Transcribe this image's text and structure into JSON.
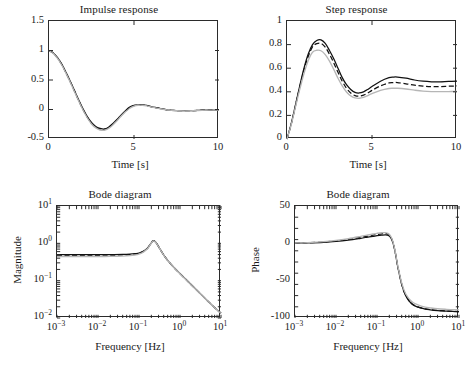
{
  "figure": {
    "panels": [
      "impulse",
      "step",
      "bode_magnitude",
      "bode_phase"
    ]
  },
  "chart_data": [
    {
      "type": "line",
      "id": "impulse",
      "title": "Impulse response",
      "xlabel": "Time [s]",
      "ylabel": "",
      "xlim": [
        0,
        10
      ],
      "ylim": [
        -0.5,
        1.5
      ],
      "xticks": [
        0,
        5,
        10
      ],
      "xticklabels": [
        "0",
        "5",
        "10"
      ],
      "yticks": [
        -0.5,
        0,
        0.5,
        1,
        1.5
      ],
      "yticklabels": [
        "-0.5",
        "0",
        "0.5",
        "1",
        "1.5"
      ],
      "grid": false,
      "legend": "none",
      "x": [
        0,
        0.25,
        0.5,
        0.75,
        1,
        1.25,
        1.5,
        1.75,
        2,
        2.25,
        2.5,
        2.75,
        3,
        3.25,
        3.5,
        3.75,
        4,
        4.25,
        4.5,
        4.75,
        5,
        5.25,
        5.5,
        5.75,
        6,
        6.5,
        7,
        7.5,
        8,
        8.5,
        9,
        9.5,
        10
      ],
      "series": [
        {
          "name": "solid",
          "style": "solid",
          "color": "#111111",
          "values": [
            1.0,
            0.96,
            0.88,
            0.77,
            0.63,
            0.48,
            0.32,
            0.16,
            0.01,
            -0.12,
            -0.22,
            -0.29,
            -0.32,
            -0.33,
            -0.3,
            -0.24,
            -0.17,
            -0.09,
            -0.02,
            0.04,
            0.07,
            0.08,
            0.08,
            0.07,
            0.05,
            0.02,
            -0.01,
            -0.02,
            -0.02,
            -0.02,
            -0.01,
            -0.01,
            -0.01
          ]
        },
        {
          "name": "dashed",
          "style": "dashed",
          "color": "#111111",
          "values": [
            1.0,
            0.955,
            0.873,
            0.762,
            0.622,
            0.47,
            0.31,
            0.15,
            0.0,
            -0.13,
            -0.235,
            -0.3,
            -0.335,
            -0.34,
            -0.31,
            -0.25,
            -0.18,
            -0.1,
            -0.03,
            0.03,
            0.065,
            0.078,
            0.077,
            0.066,
            0.048,
            0.018,
            -0.008,
            -0.018,
            -0.02,
            -0.018,
            -0.012,
            -0.008,
            -0.008
          ]
        },
        {
          "name": "gray",
          "style": "gray",
          "color": "#b6b6b6",
          "values": [
            1.0,
            0.95,
            0.866,
            0.754,
            0.613,
            0.461,
            0.3,
            0.142,
            -0.008,
            -0.14,
            -0.245,
            -0.312,
            -0.348,
            -0.352,
            -0.322,
            -0.262,
            -0.19,
            -0.11,
            -0.04,
            0.022,
            0.058,
            0.072,
            0.072,
            0.062,
            0.044,
            0.014,
            -0.01,
            -0.02,
            -0.022,
            -0.02,
            -0.014,
            -0.01,
            -0.01
          ]
        }
      ]
    },
    {
      "type": "line",
      "id": "step",
      "title": "Step response",
      "xlabel": "Time [s]",
      "ylabel": "",
      "xlim": [
        0,
        10
      ],
      "ylim": [
        0,
        1
      ],
      "xticks": [
        0,
        5,
        10
      ],
      "xticklabels": [
        "0",
        "5",
        "10"
      ],
      "yticks": [
        0,
        0.2,
        0.4,
        0.6,
        0.8,
        1
      ],
      "yticklabels": [
        "0",
        "0.2",
        "0.4",
        "0.6",
        "0.8",
        "1"
      ],
      "grid": false,
      "legend": "none",
      "x": [
        0,
        0.25,
        0.5,
        0.75,
        1,
        1.25,
        1.5,
        1.75,
        2,
        2.25,
        2.5,
        2.75,
        3,
        3.25,
        3.5,
        3.75,
        4,
        4.25,
        4.5,
        4.75,
        5,
        5.5,
        6,
        6.25,
        6.5,
        7,
        7.5,
        8,
        8.5,
        9,
        9.5,
        10
      ],
      "series": [
        {
          "name": "solid",
          "style": "solid",
          "color": "#111111",
          "values": [
            0.0,
            0.13,
            0.29,
            0.45,
            0.6,
            0.72,
            0.8,
            0.835,
            0.84,
            0.81,
            0.75,
            0.68,
            0.6,
            0.52,
            0.46,
            0.42,
            0.395,
            0.39,
            0.4,
            0.42,
            0.445,
            0.49,
            0.52,
            0.525,
            0.525,
            0.515,
            0.5,
            0.49,
            0.485,
            0.485,
            0.488,
            0.49
          ]
        },
        {
          "name": "dashed",
          "style": "dashed",
          "color": "#111111",
          "values": [
            0.0,
            0.127,
            0.283,
            0.44,
            0.585,
            0.7,
            0.78,
            0.808,
            0.81,
            0.778,
            0.718,
            0.645,
            0.565,
            0.49,
            0.43,
            0.39,
            0.368,
            0.363,
            0.372,
            0.39,
            0.412,
            0.45,
            0.475,
            0.478,
            0.478,
            0.468,
            0.456,
            0.448,
            0.444,
            0.444,
            0.447,
            0.45
          ]
        },
        {
          "name": "gray",
          "style": "gray",
          "color": "#b6b6b6",
          "values": [
            0.0,
            0.122,
            0.272,
            0.42,
            0.555,
            0.665,
            0.735,
            0.752,
            0.748,
            0.715,
            0.66,
            0.59,
            0.515,
            0.45,
            0.398,
            0.365,
            0.348,
            0.345,
            0.352,
            0.368,
            0.385,
            0.412,
            0.428,
            0.43,
            0.43,
            0.424,
            0.414,
            0.406,
            0.402,
            0.401,
            0.402,
            0.404
          ]
        }
      ]
    },
    {
      "type": "line",
      "id": "bode_magnitude",
      "title": "Bode diagram",
      "xlabel": "Frequency [Hz]",
      "ylabel": "Magnitude",
      "xscale": "log",
      "yscale": "log",
      "xlim": [
        0.001,
        10
      ],
      "ylim": [
        0.01,
        10
      ],
      "xticklabels": [
        "10-3",
        "10-2",
        "10-1",
        "100",
        "101"
      ],
      "yticklabels": [
        "101",
        "100",
        "10-1",
        "10-2"
      ],
      "grid": false,
      "legend": "none",
      "x": [
        0.001,
        0.002,
        0.005,
        0.01,
        0.02,
        0.04,
        0.06,
        0.08,
        0.1,
        0.13,
        0.16,
        0.19,
        0.22,
        0.25,
        0.3,
        0.35,
        0.4,
        0.5,
        0.7,
        1.0,
        1.5,
        2.0,
        3.0,
        5.0,
        7.0,
        10.0
      ],
      "series": [
        {
          "name": "solid",
          "style": "solid",
          "color": "#111111",
          "values": [
            0.5,
            0.5,
            0.5,
            0.5,
            0.5,
            0.505,
            0.515,
            0.53,
            0.55,
            0.62,
            0.74,
            0.95,
            1.18,
            1.1,
            0.82,
            0.62,
            0.49,
            0.35,
            0.23,
            0.155,
            0.1,
            0.073,
            0.047,
            0.027,
            0.019,
            0.0135
          ]
        },
        {
          "name": "dashed",
          "style": "dashed",
          "color": "#111111",
          "values": [
            0.48,
            0.48,
            0.48,
            0.48,
            0.485,
            0.49,
            0.5,
            0.515,
            0.54,
            0.61,
            0.73,
            0.94,
            1.17,
            1.09,
            0.815,
            0.617,
            0.488,
            0.349,
            0.229,
            0.154,
            0.0995,
            0.0727,
            0.0468,
            0.0269,
            0.0189,
            0.0134
          ]
        },
        {
          "name": "gray",
          "style": "gray",
          "color": "#b6b6b6",
          "values": [
            0.44,
            0.44,
            0.44,
            0.442,
            0.446,
            0.455,
            0.468,
            0.487,
            0.515,
            0.592,
            0.715,
            0.93,
            1.16,
            1.085,
            0.812,
            0.615,
            0.486,
            0.348,
            0.228,
            0.153,
            0.099,
            0.0724,
            0.0466,
            0.0268,
            0.0188,
            0.0133
          ]
        }
      ]
    },
    {
      "type": "line",
      "id": "bode_phase",
      "title": "Bode diagram",
      "xlabel": "Frequency [Hz]",
      "ylabel": "Phase",
      "xscale": "log",
      "yscale": "linear",
      "xlim": [
        0.001,
        10
      ],
      "ylim": [
        -100,
        50
      ],
      "xticklabels": [
        "10-3",
        "10-2",
        "10-1",
        "100",
        "101"
      ],
      "yticks": [
        -100,
        -50,
        0,
        50
      ],
      "yticklabels": [
        "-100",
        "-50",
        "0",
        "50"
      ],
      "grid": false,
      "legend": "none",
      "x": [
        0.001,
        0.002,
        0.005,
        0.01,
        0.02,
        0.04,
        0.06,
        0.08,
        0.1,
        0.13,
        0.16,
        0.19,
        0.22,
        0.25,
        0.28,
        0.32,
        0.4,
        0.5,
        0.7,
        1.0,
        1.5,
        2.0,
        3.0,
        5.0,
        7.0,
        10.0
      ],
      "series": [
        {
          "name": "solid",
          "style": "solid",
          "color": "#111111",
          "values": [
            0.3,
            0.6,
            1.4,
            2.6,
            4.4,
            6.8,
            8.4,
            9.4,
            10.2,
            11.0,
            11.4,
            10.6,
            7.0,
            -1.0,
            -13.0,
            -31.0,
            -55.0,
            -70.0,
            -81.0,
            -85.5,
            -88.0,
            -89.0,
            -90.0,
            -90.8,
            -91.2,
            -91.6
          ]
        },
        {
          "name": "dashed",
          "style": "dashed",
          "color": "#111111",
          "values": [
            0.4,
            0.8,
            1.8,
            3.2,
            5.3,
            8.0,
            9.8,
            11.0,
            11.9,
            12.8,
            13.1,
            12.0,
            8.0,
            -0.5,
            -12.5,
            -30.5,
            -54.5,
            -69.5,
            -80.5,
            -85.2,
            -87.8,
            -88.8,
            -89.8,
            -90.6,
            -91.0,
            -91.4
          ]
        },
        {
          "name": "gray",
          "style": "gray",
          "color": "#b6b6b6",
          "values": [
            0.5,
            1.0,
            2.2,
            3.9,
            6.3,
            9.3,
            11.2,
            12.5,
            13.4,
            14.2,
            14.3,
            13.0,
            8.8,
            0.2,
            -11.8,
            -29.5,
            -53.0,
            -67.5,
            -78.0,
            -82.5,
            -85.5,
            -86.5,
            -87.6,
            -88.4,
            -88.8,
            -89.2
          ]
        }
      ]
    }
  ]
}
